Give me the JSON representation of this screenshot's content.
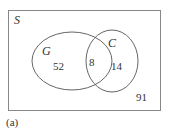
{
  "diagram": {
    "type": "venn",
    "universe_label": "S",
    "sets": [
      {
        "name": "G",
        "only_count": "52"
      },
      {
        "name": "C",
        "only_count": "14"
      }
    ],
    "intersection_count": "8",
    "outside_count": "91",
    "caption": "(a)",
    "colors": {
      "stroke": "#666666",
      "text": "#333333"
    }
  }
}
